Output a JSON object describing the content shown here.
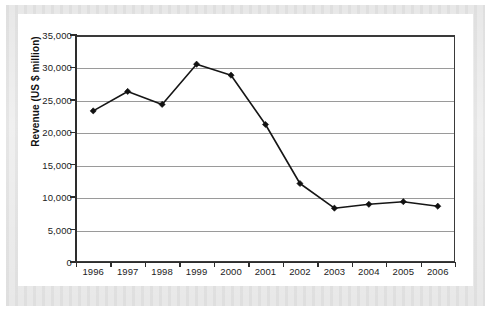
{
  "chart_data": {
    "type": "line",
    "title": "",
    "xlabel": "",
    "ylabel": "Revenue (US $ million)",
    "categories": [
      "1996",
      "1997",
      "1998",
      "1999",
      "2000",
      "2001",
      "2002",
      "2003",
      "2004",
      "2005",
      "2006"
    ],
    "values": [
      23300,
      26300,
      24300,
      30500,
      28800,
      21200,
      12100,
      8300,
      8900,
      9300,
      8600
    ],
    "series": [
      {
        "name": "Revenue",
        "values": [
          23300,
          26300,
          24300,
          30500,
          28800,
          21200,
          12100,
          8300,
          8900,
          9300,
          8600
        ]
      }
    ],
    "ylim": [
      0,
      35000
    ],
    "ytick_values": [
      0,
      5000,
      10000,
      15000,
      20000,
      25000,
      30000,
      35000
    ],
    "ytick_labels": [
      "0",
      "5,000",
      "10,000",
      "15,000",
      "20,000",
      "25,000",
      "30,000",
      "35,000"
    ],
    "xtick_labels": [
      "1996",
      "1997",
      "1998",
      "1999",
      "2000",
      "2001",
      "2002",
      "2003",
      "2004",
      "2005",
      "2006"
    ],
    "grid": "horizontal",
    "legend": "none",
    "marker": "diamond",
    "line_color": "#161616",
    "marker_color": "#111111",
    "gridline_color": "#9a9a9a",
    "axis_color": "#2d2d2d",
    "plot_background": "#ffffff"
  }
}
